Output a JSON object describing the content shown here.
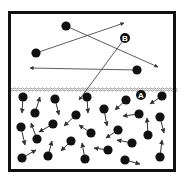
{
  "diagram": {
    "box": {
      "x": 9.5,
      "y": 12.5,
      "w": 165,
      "h": 158,
      "stroke": "#111111",
      "stroke_width": 3
    },
    "surface": {
      "y": 88.5,
      "color": "#8a8a8a"
    },
    "colors": {
      "molecule": "#111111",
      "arrow": "#333333",
      "label_bg": "#111111",
      "label_text": "#ffffff"
    },
    "labels": [
      {
        "id": "B",
        "text": "B",
        "x": 125,
        "y": 38
      },
      {
        "id": "A",
        "text": "A",
        "x": 141,
        "y": 95
      }
    ],
    "vapor_molecules": [
      {
        "x": 66,
        "y": 26,
        "ax": 158,
        "ay": 67
      },
      {
        "x": 36,
        "y": 53,
        "ax": 124,
        "ay": 23
      },
      {
        "x": 137,
        "y": 70,
        "ax": 30,
        "ay": 68
      },
      {
        "x": 125,
        "y": 38,
        "ax": 79,
        "ay": 100,
        "label": true
      }
    ],
    "liquid_molecules": [
      {
        "x": 23,
        "y": 97,
        "ax": 22,
        "ay": 113
      },
      {
        "x": 55,
        "y": 99,
        "ax": 59,
        "ay": 115
      },
      {
        "x": 87,
        "y": 97,
        "ax": 88,
        "ay": 113
      },
      {
        "x": 126,
        "y": 100,
        "ax": 115,
        "ay": 110
      },
      {
        "x": 162,
        "y": 96,
        "ax": 150,
        "ay": 104
      },
      {
        "x": 35,
        "y": 113,
        "ax": 40,
        "ay": 97
      },
      {
        "x": 104,
        "y": 109,
        "ax": 107,
        "ay": 126
      },
      {
        "x": 139,
        "y": 114,
        "ax": 123,
        "ay": 116
      },
      {
        "x": 76,
        "y": 115,
        "ax": 64,
        "ay": 126
      },
      {
        "x": 160,
        "y": 117,
        "ax": 164,
        "ay": 133
      },
      {
        "x": 21,
        "y": 127,
        "ax": 25,
        "ay": 145
      },
      {
        "x": 53,
        "y": 124,
        "ax": 39,
        "ay": 132
      },
      {
        "x": 91,
        "y": 133,
        "ax": 79,
        "ay": 125
      },
      {
        "x": 118,
        "y": 130,
        "ax": 106,
        "ay": 138
      },
      {
        "x": 37,
        "y": 139,
        "ax": 31,
        "ay": 123
      },
      {
        "x": 148,
        "y": 135,
        "ax": 147,
        "ay": 118
      },
      {
        "x": 71,
        "y": 141,
        "ax": 61,
        "ay": 151
      },
      {
        "x": 132,
        "y": 143,
        "ax": 117,
        "ay": 140
      },
      {
        "x": 108,
        "y": 150,
        "ax": 94,
        "ay": 148
      },
      {
        "x": 22,
        "y": 158,
        "ax": 36,
        "ay": 150
      },
      {
        "x": 48,
        "y": 156,
        "ax": 52,
        "ay": 141
      },
      {
        "x": 85,
        "y": 159,
        "ax": 82,
        "ay": 143
      },
      {
        "x": 125,
        "y": 160,
        "ax": 140,
        "ay": 164
      },
      {
        "x": 160,
        "y": 157,
        "ax": 162,
        "ay": 140
      }
    ]
  }
}
